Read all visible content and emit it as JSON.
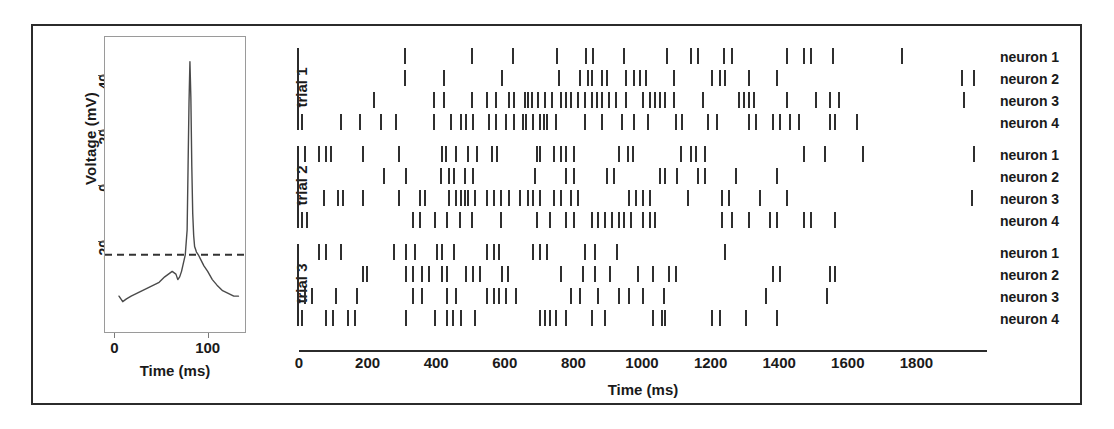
{
  "figure": {
    "background": "#ffffff",
    "frame_color": "#2b2b2b",
    "spike_color": "#2f2f2f"
  },
  "waveform_panel": {
    "ylabel": "Voltage (mV)",
    "xlabel": "Time (ms)",
    "yticks": [
      "40",
      "20",
      "0",
      "-20"
    ],
    "xticks": [
      "0",
      "100"
    ],
    "threshold_label": ""
  },
  "raster_panel": {
    "xlabel": "Time (ms)",
    "xticks": [
      "0",
      "200",
      "400",
      "600",
      "800",
      "1000",
      "1200",
      "1400",
      "1600",
      "1800"
    ],
    "trials": [
      "trial 1",
      "trial 2",
      "trial 3"
    ],
    "neurons": [
      "neuron 1",
      "neuron 2",
      "neuron 3",
      "neuron 4"
    ]
  },
  "chart_data": [
    {
      "type": "line",
      "title": "Action potential waveform",
      "xlabel": "Time (ms)",
      "ylabel": "Voltage (mV)",
      "xlim": [
        -10,
        140
      ],
      "ylim": [
        -55,
        52
      ],
      "xticks": [
        0,
        100
      ],
      "yticks": [
        40,
        20,
        0,
        -20
      ],
      "grid": false,
      "legend": "none",
      "annotations": [
        {
          "kind": "hline",
          "label": "spike detection threshold",
          "y": -27,
          "style": "dashed"
        }
      ],
      "x": [
        5,
        9,
        13,
        18,
        24,
        30,
        36,
        42,
        48,
        54,
        58,
        62,
        66,
        68,
        70,
        72,
        74,
        76,
        78,
        79,
        80,
        81,
        82,
        83,
        84,
        85,
        86,
        88,
        90,
        93,
        96,
        100,
        105,
        110,
        116,
        122,
        128,
        133
      ],
      "y": [
        -42,
        -44,
        -43,
        -42,
        -41,
        -40,
        -39,
        -38,
        -37,
        -35,
        -34,
        -33,
        -34,
        -36,
        -35,
        -33,
        -30,
        -27,
        -18,
        5,
        28,
        43,
        30,
        5,
        -12,
        -20,
        -24,
        -26,
        -27,
        -29,
        -31,
        -33,
        -36,
        -38,
        -40,
        -41,
        -42,
        -42
      ]
    },
    {
      "type": "raster",
      "title": "Multi-neuron spike raster",
      "xlabel": "Time (ms)",
      "ylabel": "",
      "xlim": [
        0,
        2000
      ],
      "xticks": [
        0,
        200,
        400,
        600,
        800,
        1000,
        1200,
        1400,
        1600,
        1800
      ],
      "grid": false,
      "legend": "right",
      "trials": [
        {
          "name": "trial 1",
          "rows": [
            {
              "neuron": "neuron 1",
              "spikes": [
                305,
                500,
                620,
                750,
                835,
                855,
                945,
                1070,
                1140,
                1160,
                1235,
                1260,
                1420,
                1470,
                1490,
                1555,
                1755
              ]
            },
            {
              "neuron": "neuron 2",
              "spikes": [
                307,
                420,
                590,
                755,
                815,
                840,
                850,
                880,
                895,
                950,
                975,
                990,
                1010,
                1090,
                1200,
                1225,
                1240,
                1310,
                1390,
                1930,
                1965
              ]
            },
            {
              "neuron": "neuron 3",
              "spikes": [
                215,
                390,
                420,
                500,
                545,
                570,
                610,
                625,
                655,
                665,
                675,
                695,
                715,
                735,
                760,
                775,
                790,
                810,
                830,
                850,
                865,
                880,
                900,
                920,
                950,
                1000,
                1020,
                1035,
                1050,
                1065,
                1090,
                1175,
                1280,
                1295,
                1310,
                1325,
                1420,
                1505,
                1545,
                1570,
                1935
              ]
            },
            {
              "neuron": "neuron 4",
              "spikes": [
                5,
                120,
                175,
                235,
                280,
                390,
                440,
                470,
                485,
                505,
                550,
                570,
                600,
                625,
                650,
                660,
                680,
                700,
                710,
                720,
                745,
                830,
                880,
                940,
                975,
                1015,
                1095,
                1115,
                1190,
                1215,
                1310,
                1330,
                1380,
                1400,
                1430,
                1455,
                1545,
                1560,
                1625
              ]
            }
          ]
        },
        {
          "name": "trial 2",
          "rows": [
            {
              "neuron": "neuron 1",
              "spikes": [
                15,
                55,
                75,
                90,
                185,
                290,
                415,
                425,
                455,
                490,
                515,
                560,
                575,
                690,
                700,
                740,
                760,
                775,
                800,
                930,
                955,
                970,
                1110,
                1140,
                1155,
                1180,
                1470,
                1530,
                1640,
                1965
              ]
            },
            {
              "neuron": "neuron 2",
              "spikes": [
                245,
                310,
                410,
                435,
                450,
                480,
                505,
                685,
                775,
                800,
                895,
                915,
                1050,
                1065,
                1100,
                1160,
                1180,
                1270,
                1390
              ]
            },
            {
              "neuron": "neuron 3",
              "spikes": [
                70,
                110,
                125,
                185,
                290,
                350,
                365,
                435,
                455,
                470,
                480,
                490,
                510,
                545,
                565,
                585,
                610,
                640,
                665,
                680,
                700,
                740,
                760,
                790,
                810,
                960,
                980,
                1000,
                1020,
                1130,
                1230,
                1250,
                1340,
                1420,
                1960
              ]
            },
            {
              "neuron": "neuron 4",
              "spikes": [
                5,
                20,
                330,
                350,
                395,
                430,
                465,
                500,
                585,
                690,
                730,
                775,
                800,
                850,
                870,
                890,
                910,
                930,
                945,
                965,
                1000,
                1020,
                1035,
                1230,
                1260,
                1310,
                1370,
                1390,
                1470,
                1490,
                1560
              ]
            }
          ]
        },
        {
          "name": "trial 3",
          "rows": [
            {
              "neuron": "neuron 1",
              "spikes": [
                55,
                75,
                120,
                275,
                310,
                335,
                400,
                415,
                450,
                545,
                565,
                580,
                680,
                700,
                720,
                830,
                860,
                925,
                1240
              ]
            },
            {
              "neuron": "neuron 2",
              "spikes": [
                185,
                195,
                310,
                330,
                355,
                375,
                415,
                430,
                485,
                505,
                525,
                590,
                605,
                760,
                825,
                860,
                905,
                985,
                1030,
                1075,
                1095,
                1380,
                1400,
                1545,
                1560
              ]
            },
            {
              "neuron": "neuron 3",
              "spikes": [
                15,
                35,
                105,
                165,
                330,
                355,
                430,
                455,
                545,
                565,
                580,
                600,
                630,
                790,
                815,
                870,
                930,
                960,
                1000,
                1060,
                1360,
                1535
              ]
            },
            {
              "neuron": "neuron 4",
              "spikes": [
                5,
                75,
                95,
                140,
                160,
                310,
                395,
                430,
                445,
                470,
                510,
                700,
                715,
                730,
                745,
                775,
                850,
                890,
                1030,
                1055,
                1065,
                1200,
                1225,
                1300,
                1390
              ]
            }
          ]
        }
      ]
    }
  ]
}
